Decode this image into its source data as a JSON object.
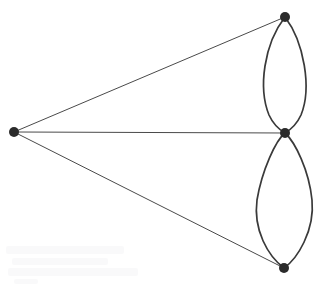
{
  "figure": {
    "width": 327,
    "height": 287,
    "background_color": "#ffffff",
    "vertex_color": "#2b2b2b",
    "straight_edge_color": "#4a4a4a",
    "curved_edge_color": "#3a3a3a"
  },
  "chart_data": {
    "type": "diagram",
    "subtype": "node-link-graph",
    "directed": false,
    "vertex_count": 4,
    "edge_count": 7,
    "vertices": [
      {
        "id": "v-left",
        "label": "",
        "x": 14,
        "y": 132,
        "radius": 5.0,
        "degree": 3
      },
      {
        "id": "v-top",
        "label": "",
        "x": 285,
        "y": 17,
        "radius": 5.0,
        "degree": 3
      },
      {
        "id": "v-middle",
        "label": "",
        "x": 285,
        "y": 133,
        "radius": 5.0,
        "degree": 5
      },
      {
        "id": "v-bottom",
        "label": "",
        "x": 284,
        "y": 268,
        "radius": 5.0,
        "degree": 3
      }
    ],
    "edges": [
      {
        "id": "e-left-top",
        "from": "v-left",
        "to": "v-top",
        "style": "straight",
        "path": "M 14 132 L 285 17"
      },
      {
        "id": "e-left-middle",
        "from": "v-left",
        "to": "v-middle",
        "style": "straight",
        "path": "M 14 132 L 285 133"
      },
      {
        "id": "e-left-bottom",
        "from": "v-left",
        "to": "v-bottom",
        "style": "straight",
        "path": "M 14 132 L 284 268"
      },
      {
        "id": "e-top-middle-left",
        "from": "v-top",
        "to": "v-middle",
        "style": "curved",
        "bulge": "left",
        "path": "M 285 17 C 264 44 258 88 269 115 C 274 126 280 130 285 133"
      },
      {
        "id": "e-top-middle-right",
        "from": "v-top",
        "to": "v-middle",
        "style": "curved",
        "bulge": "right",
        "path": "M 285 17 C 304 42 312 88 301 115 C 296 126 290 130 285 133"
      },
      {
        "id": "e-middle-bottom-left",
        "from": "v-middle",
        "to": "v-bottom",
        "style": "curved",
        "bulge": "left",
        "path": "M 285 133 C 276 140 262 170 257 200 C 253 230 268 256 284 268"
      },
      {
        "id": "e-middle-bottom-right",
        "from": "v-middle",
        "to": "v-bottom",
        "style": "curved",
        "bulge": "right",
        "path": "M 285 133 C 295 142 309 170 312 200 C 315 231 297 259 284 268"
      }
    ],
    "axis_labels": null,
    "legend": null,
    "grid": false
  },
  "scan_artifacts": [
    {
      "x": 6,
      "y": 246,
      "w": 118,
      "h": 8
    },
    {
      "x": 12,
      "y": 258,
      "w": 96,
      "h": 7
    },
    {
      "x": 8,
      "y": 268,
      "w": 130,
      "h": 8
    },
    {
      "x": 14,
      "y": 279,
      "w": 24,
      "h": 5
    }
  ]
}
